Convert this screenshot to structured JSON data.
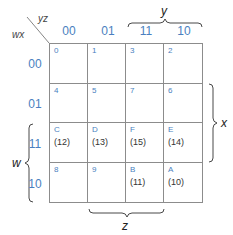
{
  "corner": {
    "row_vars": "wx",
    "col_vars": "yz"
  },
  "columns": [
    "00",
    "01",
    "11",
    "10"
  ],
  "rows": [
    "00",
    "01",
    "11",
    "10"
  ],
  "cells": [
    [
      {
        "index": "0",
        "decimal": ""
      },
      {
        "index": "1",
        "decimal": ""
      },
      {
        "index": "3",
        "decimal": ""
      },
      {
        "index": "2",
        "decimal": ""
      }
    ],
    [
      {
        "index": "4",
        "decimal": ""
      },
      {
        "index": "5",
        "decimal": ""
      },
      {
        "index": "7",
        "decimal": ""
      },
      {
        "index": "6",
        "decimal": ""
      }
    ],
    [
      {
        "index": "C",
        "decimal": "(12)"
      },
      {
        "index": "D",
        "decimal": "(13)"
      },
      {
        "index": "F",
        "decimal": "(15)"
      },
      {
        "index": "E",
        "decimal": "(14)"
      }
    ],
    [
      {
        "index": "8",
        "decimal": ""
      },
      {
        "index": "9",
        "decimal": ""
      },
      {
        "index": "B",
        "decimal": "(11)"
      },
      {
        "index": "A",
        "decimal": "(10)"
      }
    ]
  ],
  "braces": {
    "top": "y",
    "right": "x",
    "left": "w",
    "bottom": "z"
  },
  "colors": {
    "label": "#4a7fc0",
    "grid": "#8c8c8c",
    "text": "#333333"
  }
}
